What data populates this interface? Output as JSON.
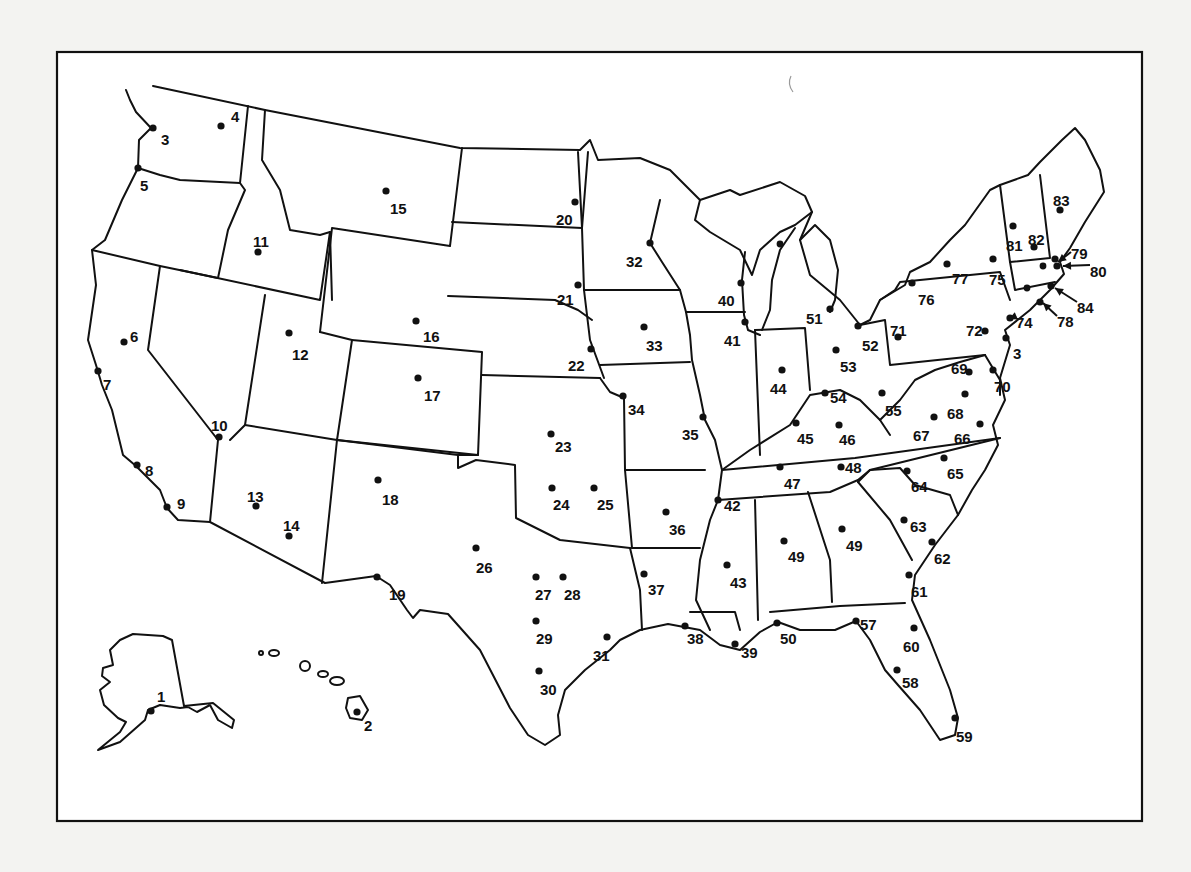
{
  "map": {
    "type": "US station location map (numbered dots)",
    "frame": {
      "x": 57,
      "y": 52,
      "width": 1085,
      "height": 769
    },
    "colors": {
      "ink": "#111111",
      "paper": "#ffffff",
      "background": "#f3f3f1"
    },
    "markers": [
      {
        "id": 1,
        "label": "1",
        "dot": [
          151,
          711
        ],
        "text": [
          157,
          697
        ]
      },
      {
        "id": 2,
        "label": "2",
        "dot": [
          357,
          712
        ],
        "text": [
          364,
          726
        ]
      },
      {
        "id": "3a",
        "label": "3",
        "dot": [
          153,
          128
        ],
        "text": [
          161,
          140
        ]
      },
      {
        "id": 4,
        "label": "4",
        "dot": [
          221,
          126
        ],
        "text": [
          231,
          117
        ]
      },
      {
        "id": 5,
        "label": "5",
        "dot": [
          138,
          168
        ],
        "text": [
          140,
          186
        ]
      },
      {
        "id": 6,
        "label": "6",
        "dot": [
          124,
          342
        ],
        "text": [
          130,
          337
        ]
      },
      {
        "id": 7,
        "label": "7",
        "dot": [
          98,
          371
        ],
        "text": [
          103,
          385
        ]
      },
      {
        "id": 8,
        "label": "8",
        "dot": [
          137,
          465
        ],
        "text": [
          145,
          471
        ]
      },
      {
        "id": 9,
        "label": "9",
        "dot": [
          167,
          507
        ],
        "text": [
          177,
          504
        ]
      },
      {
        "id": 10,
        "label": "10",
        "dot": [
          219,
          437
        ],
        "text": [
          211,
          426
        ]
      },
      {
        "id": 11,
        "label": "11",
        "dot": [
          258,
          252
        ],
        "text": [
          253,
          242
        ]
      },
      {
        "id": 12,
        "label": "12",
        "dot": [
          289,
          333
        ],
        "text": [
          292,
          355
        ]
      },
      {
        "id": 13,
        "label": "13",
        "dot": [
          256,
          506
        ],
        "text": [
          247,
          497
        ]
      },
      {
        "id": 14,
        "label": "14",
        "dot": [
          289,
          536
        ],
        "text": [
          283,
          526
        ]
      },
      {
        "id": 15,
        "label": "15",
        "dot": [
          386,
          191
        ],
        "text": [
          390,
          209
        ]
      },
      {
        "id": 16,
        "label": "16",
        "dot": [
          416,
          321
        ],
        "text": [
          423,
          337
        ]
      },
      {
        "id": 17,
        "label": "17",
        "dot": [
          418,
          378
        ],
        "text": [
          424,
          396
        ]
      },
      {
        "id": 18,
        "label": "18",
        "dot": [
          378,
          480
        ],
        "text": [
          382,
          500
        ]
      },
      {
        "id": 19,
        "label": "19",
        "dot": [
          377,
          577
        ],
        "text": [
          389,
          595
        ]
      },
      {
        "id": 20,
        "label": "20",
        "dot": [
          575,
          202
        ],
        "text": [
          556,
          220
        ]
      },
      {
        "id": 21,
        "label": "21",
        "dot": [
          578,
          285
        ],
        "text": [
          557,
          300
        ]
      },
      {
        "id": 22,
        "label": "22",
        "dot": [
          591,
          349
        ],
        "text": [
          568,
          366
        ]
      },
      {
        "id": 23,
        "label": "23",
        "dot": [
          551,
          434
        ],
        "text": [
          555,
          447
        ]
      },
      {
        "id": 24,
        "label": "24",
        "dot": [
          552,
          488
        ],
        "text": [
          553,
          505
        ]
      },
      {
        "id": 25,
        "label": "25",
        "dot": [
          594,
          488
        ],
        "text": [
          597,
          505
        ]
      },
      {
        "id": 26,
        "label": "26",
        "dot": [
          476,
          548
        ],
        "text": [
          476,
          568
        ]
      },
      {
        "id": 27,
        "label": "27",
        "dot": [
          536,
          577
        ],
        "text": [
          535,
          595
        ]
      },
      {
        "id": 28,
        "label": "28",
        "dot": [
          563,
          577
        ],
        "text": [
          564,
          595
        ]
      },
      {
        "id": 29,
        "label": "29",
        "dot": [
          536,
          621
        ],
        "text": [
          536,
          639
        ]
      },
      {
        "id": 30,
        "label": "30",
        "dot": [
          539,
          671
        ],
        "text": [
          540,
          690
        ]
      },
      {
        "id": 31,
        "label": "31",
        "dot": [
          607,
          637
        ],
        "text": [
          593,
          656
        ]
      },
      {
        "id": 32,
        "label": "32",
        "dot": [
          650,
          243
        ],
        "text": [
          626,
          262
        ]
      },
      {
        "id": 33,
        "label": "33",
        "dot": [
          644,
          327
        ],
        "text": [
          646,
          346
        ]
      },
      {
        "id": 34,
        "label": "34",
        "dot": [
          623,
          396
        ],
        "text": [
          628,
          410
        ]
      },
      {
        "id": 35,
        "label": "35",
        "dot": [
          703,
          417
        ],
        "text": [
          682,
          435
        ]
      },
      {
        "id": 36,
        "label": "36",
        "dot": [
          666,
          512
        ],
        "text": [
          669,
          530
        ]
      },
      {
        "id": 37,
        "label": "37",
        "dot": [
          644,
          574
        ],
        "text": [
          648,
          590
        ]
      },
      {
        "id": 38,
        "label": "38",
        "dot": [
          685,
          626
        ],
        "text": [
          687,
          639
        ]
      },
      {
        "id": 39,
        "label": "39",
        "dot": [
          735,
          644
        ],
        "text": [
          741,
          653
        ]
      },
      {
        "id": 40,
        "label": "40",
        "dot": [
          741,
          283
        ],
        "text": [
          718,
          301
        ]
      },
      {
        "id": 41,
        "label": "41",
        "dot": [
          745,
          322
        ],
        "text": [
          724,
          341
        ]
      },
      {
        "id": 42,
        "label": "42",
        "dot": [
          718,
          500
        ],
        "text": [
          724,
          506
        ]
      },
      {
        "id": 43,
        "label": "43",
        "dot": [
          727,
          565
        ],
        "text": [
          730,
          583
        ]
      },
      {
        "id": 44,
        "label": "44",
        "dot": [
          782,
          370
        ],
        "text": [
          770,
          389
        ]
      },
      {
        "id": 45,
        "label": "45",
        "dot": [
          796,
          423
        ],
        "text": [
          797,
          439
        ]
      },
      {
        "id": 46,
        "label": "46",
        "dot": [
          839,
          425
        ],
        "text": [
          839,
          440
        ]
      },
      {
        "id": 47,
        "label": "47",
        "dot": [
          780,
          467
        ],
        "text": [
          784,
          484
        ]
      },
      {
        "id": 48,
        "label": "48",
        "dot": [
          841,
          467
        ],
        "text": [
          845,
          468
        ]
      },
      {
        "id": "49a",
        "label": "49",
        "dot": [
          784,
          541
        ],
        "text": [
          788,
          557
        ]
      },
      {
        "id": "49b",
        "label": "49",
        "dot": [
          842,
          529
        ],
        "text": [
          846,
          546
        ]
      },
      {
        "id": 50,
        "label": "50",
        "dot": [
          777,
          623
        ],
        "text": [
          780,
          639
        ]
      },
      {
        "id": 51,
        "label": "51",
        "dot": [
          830,
          309
        ],
        "text": [
          806,
          319
        ]
      },
      {
        "id": 52,
        "label": "52",
        "dot": [
          858,
          326
        ],
        "text": [
          862,
          346
        ]
      },
      {
        "id": 53,
        "label": "53",
        "dot": [
          836,
          350
        ],
        "text": [
          840,
          367
        ]
      },
      {
        "id": 54,
        "label": "54",
        "dot": [
          825,
          393
        ],
        "text": [
          830,
          398
        ]
      },
      {
        "id": 55,
        "label": "55",
        "dot": [
          882,
          393
        ],
        "text": [
          885,
          411
        ]
      },
      {
        "id": 57,
        "label": "57",
        "dot": [
          856,
          621
        ],
        "text": [
          860,
          625
        ]
      },
      {
        "id": 58,
        "label": "58",
        "dot": [
          897,
          670
        ],
        "text": [
          902,
          683
        ]
      },
      {
        "id": 59,
        "label": "59",
        "dot": [
          955,
          718
        ],
        "text": [
          956,
          737
        ]
      },
      {
        "id": 60,
        "label": "60",
        "dot": [
          914,
          628
        ],
        "text": [
          903,
          647
        ]
      },
      {
        "id": 61,
        "label": "61",
        "dot": [
          909,
          575
        ],
        "text": [
          911,
          592
        ]
      },
      {
        "id": 62,
        "label": "62",
        "dot": [
          932,
          542
        ],
        "text": [
          934,
          559
        ]
      },
      {
        "id": 63,
        "label": "63",
        "dot": [
          904,
          520
        ],
        "text": [
          910,
          527
        ]
      },
      {
        "id": 64,
        "label": "64",
        "dot": [
          907,
          471
        ],
        "text": [
          911,
          487
        ]
      },
      {
        "id": 65,
        "label": "65",
        "dot": [
          944,
          458
        ],
        "text": [
          947,
          474
        ]
      },
      {
        "id": 66,
        "label": "66",
        "dot": [
          980,
          424
        ],
        "text": [
          954,
          439
        ]
      },
      {
        "id": 67,
        "label": "67",
        "dot": [
          934,
          417
        ],
        "text": [
          913,
          436
        ]
      },
      {
        "id": 68,
        "label": "68",
        "dot": [
          965,
          394
        ],
        "text": [
          947,
          414
        ]
      },
      {
        "id": 69,
        "label": "69",
        "dot": [
          969,
          372
        ],
        "text": [
          951,
          369
        ]
      },
      {
        "id": 70,
        "label": "70",
        "dot": [
          993,
          370
        ],
        "text": [
          994,
          387
        ]
      },
      {
        "id": 71,
        "label": "71",
        "dot": [
          898,
          337
        ],
        "text": [
          890,
          331
        ]
      },
      {
        "id": 72,
        "label": "72",
        "dot": [
          985,
          331
        ],
        "text": [
          966,
          331
        ]
      },
      {
        "id": "3b",
        "label": "3",
        "dot": [
          1006,
          338
        ],
        "text": [
          1013,
          354
        ]
      },
      {
        "id": 74,
        "label": "74",
        "dot": [
          1010,
          318
        ],
        "text": [
          1016,
          323
        ]
      },
      {
        "id": 75,
        "label": "75",
        "dot": [
          993,
          259
        ],
        "text": [
          989,
          280
        ]
      },
      {
        "id": 76,
        "label": "76",
        "dot": [
          912,
          283
        ],
        "text": [
          918,
          300
        ]
      },
      {
        "id": 77,
        "label": "77",
        "dot": [
          947,
          264
        ],
        "text": [
          952,
          279
        ]
      },
      {
        "id": 78,
        "label": "78",
        "dot": [
          1040,
          302
        ],
        "text": [
          1057,
          322
        ]
      },
      {
        "id": 79,
        "label": "79",
        "dot": [
          1055,
          259
        ],
        "text": [
          1071,
          254
        ]
      },
      {
        "id": 80,
        "label": "80",
        "dot": [
          1057,
          266
        ],
        "text": [
          1090,
          272
        ]
      },
      {
        "id": 81,
        "label": "81",
        "dot": [
          1013,
          226
        ],
        "text": [
          1006,
          246
        ]
      },
      {
        "id": 82,
        "label": "82",
        "dot": [
          1034,
          247
        ],
        "text": [
          1028,
          240
        ]
      },
      {
        "id": 83,
        "label": "83",
        "dot": [
          1060,
          210
        ],
        "text": [
          1053,
          201
        ]
      },
      {
        "id": 84,
        "label": "84",
        "dot": [
          1051,
          286
        ],
        "text": [
          1077,
          308
        ]
      }
    ],
    "extra_dots": [
      {
        "name": "ny-west-dot",
        "dot": [
          1027,
          288
        ]
      },
      {
        "name": "ma-dot",
        "dot": [
          1043,
          266
        ]
      },
      {
        "name": "mi-north-dot",
        "dot": [
          780,
          244
        ]
      }
    ],
    "arrows": [
      {
        "for": "79",
        "from": [
          1071,
          252
        ],
        "to": [
          1058,
          262
        ]
      },
      {
        "for": "80",
        "from": [
          1090,
          265
        ],
        "to": [
          1063,
          266
        ]
      },
      {
        "for": "84",
        "from": [
          1077,
          302
        ],
        "to": [
          1055,
          288
        ]
      },
      {
        "for": "78",
        "from": [
          1057,
          316
        ],
        "to": [
          1043,
          303
        ]
      },
      {
        "for": "74",
        "from": [
          1016,
          316
        ],
        "to": [
          1009,
          319
        ]
      }
    ]
  }
}
